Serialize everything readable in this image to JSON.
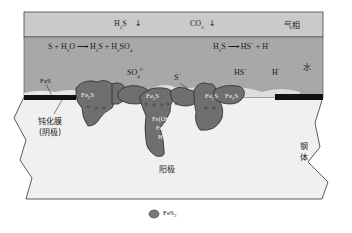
{
  "diagram": {
    "type": "H2S/CO2 corrosion mechanism of steel with FeS2 scale",
    "colors": {
      "gas_phase": "#c9c9c9",
      "water_phase": "#a9a9a9",
      "steel": "#efefef",
      "scale": "#6e6e6e",
      "passive_film": "#111111",
      "outline": "#333333"
    },
    "gas_phase": {
      "label": "气相",
      "species": [
        {
          "name": "H2S",
          "base": "H",
          "sub": "2",
          "rest": "S",
          "arrow": "↓"
        },
        {
          "name": "CO2",
          "base": "CO",
          "sub": "2",
          "rest": "",
          "arrow": "↓"
        }
      ]
    },
    "water_phase": {
      "label": "水",
      "reaction_left": {
        "parts": [
          "S + H",
          "2",
          "O ⟶ H",
          "2",
          "S + H",
          "2",
          "SO",
          "4"
        ]
      },
      "reaction_right": {
        "parts": [
          "H",
          "2",
          "S ⟶ HS",
          "−",
          " + H",
          "+"
        ]
      },
      "ions": {
        "so4": {
          "base": "SO",
          "sub": "4",
          "sup": "2−"
        },
        "s": {
          "base": "S",
          "sup": "−"
        },
        "hs": {
          "base": "HS",
          "sup": "−"
        },
        "h": {
          "base": "H",
          "sup": "+"
        }
      },
      "fes_label": "FeS"
    },
    "interface": {
      "passive_film_label_line1": "钝化膜",
      "passive_film_label_line2": "(阴极)",
      "anode_label": "阳极",
      "scale_nodules": [
        {
          "base": "Fe",
          "sub": "2",
          "rest": "S"
        },
        {
          "base": "Fe",
          "sub": "2",
          "rest": "S"
        },
        {
          "base": "Fe",
          "sub": "2",
          "rest": "S"
        },
        {
          "base": "Fe",
          "sub": "2",
          "rest": "S"
        }
      ],
      "pit_species": [
        "Fe(OH)",
        "Fe",
        "2+",
        "H",
        "+"
      ]
    },
    "steel": {
      "label_line1": "钢",
      "label_line2": "体"
    },
    "legend": {
      "label_base": "FeS",
      "label_sub": "2"
    }
  }
}
